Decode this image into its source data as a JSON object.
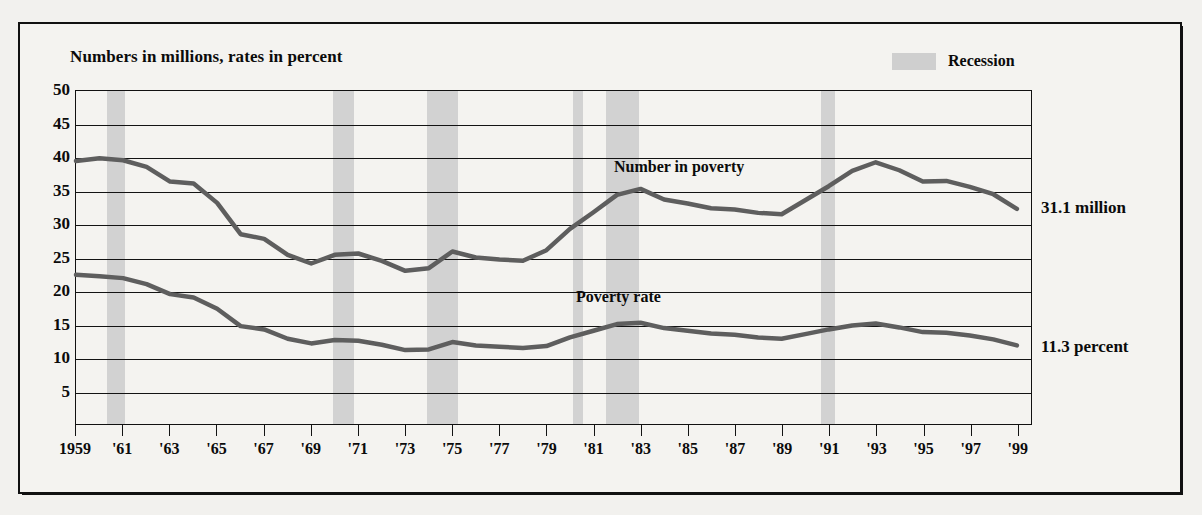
{
  "chart_data": {
    "type": "line",
    "title": "Numbers in millions, rates in percent",
    "xlabel": "",
    "ylabel": "",
    "ylim": [
      0,
      50
    ],
    "ytick_values": [
      50,
      45,
      40,
      35,
      30,
      25,
      20,
      15,
      10,
      5
    ],
    "ytick_labels": [
      "50",
      "45",
      "40",
      "35",
      "30",
      "25",
      "20",
      "15",
      "10",
      "5"
    ],
    "grid": true,
    "legend_position": "top-right",
    "legend": [
      {
        "label": "Recession",
        "color": "#d2d2d2",
        "type": "band"
      }
    ],
    "x": [
      1959,
      1960,
      1961,
      1962,
      1963,
      1964,
      1965,
      1966,
      1967,
      1968,
      1969,
      1970,
      1971,
      1972,
      1973,
      1974,
      1975,
      1976,
      1977,
      1978,
      1979,
      1980,
      1981,
      1982,
      1983,
      1984,
      1985,
      1986,
      1987,
      1988,
      1989,
      1990,
      1991,
      1992,
      1993,
      1994,
      1995,
      1996,
      1997,
      1998,
      1999
    ],
    "xtick_labels": [
      "1959",
      "'61",
      "'63",
      "'65",
      "'67",
      "'69",
      "'71",
      "'73",
      "'75",
      "'77",
      "'79",
      "'81",
      "'83",
      "'85",
      "'87",
      "'89",
      "'91",
      "'93",
      "'95",
      "'97",
      "'99"
    ],
    "xtick_years": [
      1959,
      1961,
      1963,
      1965,
      1967,
      1969,
      1971,
      1973,
      1975,
      1977,
      1979,
      1981,
      1983,
      1985,
      1987,
      1989,
      1991,
      1993,
      1995,
      1997,
      1999
    ],
    "series": [
      {
        "name": "Number in poverty",
        "units": "millions",
        "color": "#5e5e5e",
        "end_label": "31.1 million",
        "values": [
          39.5,
          39.9,
          39.6,
          38.6,
          36.4,
          36.1,
          33.2,
          28.5,
          27.8,
          25.4,
          24.1,
          25.4,
          25.6,
          24.5,
          23.0,
          23.4,
          25.9,
          25.0,
          24.7,
          24.5,
          26.1,
          29.3,
          31.8,
          34.4,
          35.3,
          33.7,
          33.1,
          32.4,
          32.2,
          31.7,
          31.5,
          33.6,
          35.7,
          38.0,
          39.3,
          38.1,
          36.4,
          36.5,
          35.6,
          34.5,
          32.3
        ]
      },
      {
        "name": "Poverty rate",
        "units": "percent",
        "color": "#5e5e5e",
        "end_label": "11.3 percent",
        "values": [
          22.4,
          22.2,
          21.9,
          21.0,
          19.5,
          19.0,
          17.3,
          14.7,
          14.2,
          12.8,
          12.1,
          12.6,
          12.5,
          11.9,
          11.1,
          11.2,
          12.3,
          11.8,
          11.6,
          11.4,
          11.7,
          13.0,
          14.0,
          15.0,
          15.2,
          14.4,
          14.0,
          13.6,
          13.4,
          13.0,
          12.8,
          13.5,
          14.2,
          14.8,
          15.1,
          14.5,
          13.8,
          13.7,
          13.3,
          12.7,
          11.8
        ]
      }
    ],
    "recessions": [
      {
        "label": "1960-61",
        "start": 1960.3,
        "end": 1961.1
      },
      {
        "label": "1969-70",
        "start": 1969.9,
        "end": 1970.8
      },
      {
        "label": "1973-75",
        "start": 1973.9,
        "end": 1975.2
      },
      {
        "label": "1980",
        "start": 1980.1,
        "end": 1980.5
      },
      {
        "label": "1981-82",
        "start": 1981.5,
        "end": 1982.9
      },
      {
        "label": "1990-91",
        "start": 1990.6,
        "end": 1991.2
      }
    ],
    "annotations": [
      {
        "text": "Number in poverty",
        "series": "Number in poverty"
      },
      {
        "text": "Poverty rate",
        "series": "Poverty rate"
      }
    ]
  },
  "colors": {
    "line": "#5e5e5e",
    "recession_band": "#d2d2d2",
    "axis": "#131313",
    "page_background": "#f2f1ee",
    "plot_background": "#f4f3f0"
  }
}
